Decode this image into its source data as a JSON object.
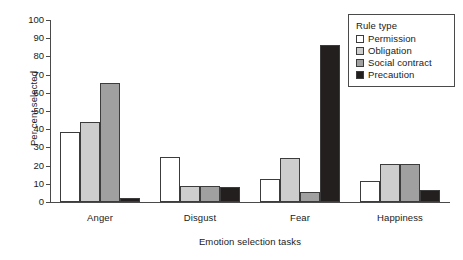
{
  "chart_data": {
    "type": "bar",
    "title": "",
    "xlabel": "Emotion selection tasks",
    "ylabel": "Per cent selected",
    "categories": [
      "Anger",
      "Disgust",
      "Fear",
      "Happiness"
    ],
    "series": [
      {
        "name": "Permission",
        "color": "#ffffff",
        "values": [
          38.5,
          24.5,
          12.5,
          11.5
        ]
      },
      {
        "name": "Obligation",
        "color": "#cdcdcd",
        "values": [
          44,
          9,
          24,
          21
        ]
      },
      {
        "name": "Social contract",
        "color": "#a0a0a0",
        "values": [
          65.5,
          9,
          5.5,
          21
        ]
      },
      {
        "name": "Precaution",
        "color": "#231f1e",
        "values": [
          2,
          8.5,
          86,
          6.5
        ]
      }
    ],
    "ylim": [
      0,
      100
    ],
    "yticks": [
      0,
      10,
      20,
      30,
      40,
      50,
      60,
      70,
      80,
      90,
      100
    ],
    "ytick_labels": [
      "0",
      "10",
      "20",
      "30",
      "40",
      "50",
      "60",
      "70",
      "80",
      "90",
      "100"
    ],
    "grid": false,
    "legend_title": "Rule type",
    "legend_position": "top-right"
  }
}
